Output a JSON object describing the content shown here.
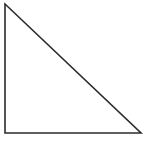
{
  "figure": {
    "name": "right-triangle",
    "background_color": "#ffffff",
    "stroke_color": "#2b2b2b",
    "fill_color": "#ffffff",
    "stroke_width": 1.6,
    "canvas": {
      "width": 146,
      "height": 141
    },
    "vertices": [
      {
        "label": "top-left-apex",
        "x": 5,
        "y": 4
      },
      {
        "label": "bottom-right",
        "x": 141,
        "y": 133
      },
      {
        "label": "bottom-left-right-angle",
        "x": 5,
        "y": 133
      }
    ],
    "points_attr": "5,4 141,133 5,133",
    "edges": [
      {
        "name": "vertical-leg",
        "from": "top-left-apex",
        "to": "bottom-left-right-angle"
      },
      {
        "name": "horizontal-leg",
        "from": "bottom-left-right-angle",
        "to": "bottom-right"
      },
      {
        "name": "hypotenuse",
        "from": "top-left-apex",
        "to": "bottom-right"
      }
    ]
  }
}
